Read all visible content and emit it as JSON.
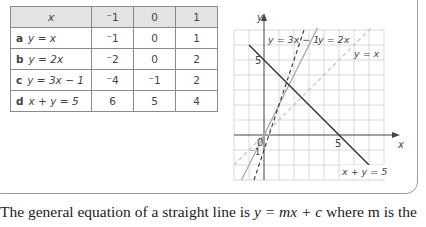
{
  "table": {
    "header": {
      "label": "x",
      "cols": [
        "⁻1",
        "0",
        "1"
      ]
    },
    "rows": [
      {
        "letter": "a",
        "equation": "y = x",
        "values": [
          "⁻1",
          "0",
          "1"
        ]
      },
      {
        "letter": "b",
        "equation": "y = 2x",
        "values": [
          "⁻2",
          "0",
          "2"
        ]
      },
      {
        "letter": "c",
        "equation": "y = 3x − 1",
        "values": [
          "⁻4",
          "⁻1",
          "2"
        ]
      },
      {
        "letter": "d",
        "equation": "x + y = 5",
        "values": [
          "6",
          "5",
          "4"
        ]
      }
    ]
  },
  "graph": {
    "x_axis_label": "x",
    "y_axis_label": "y",
    "origin_label": "0",
    "tick_x_5": "5",
    "tick_y_5": "5",
    "tick_y_neg1": "⁻1",
    "line_labels": {
      "y3x1": "y = 3x − 1",
      "y2x": "y = 2x",
      "yx": "y = x",
      "xy5": "x + y = 5"
    }
  },
  "paragraph": {
    "text_before": "The general equation of a straight line is ",
    "equation": "y = mx + c",
    "text_after": " where m is the"
  }
}
